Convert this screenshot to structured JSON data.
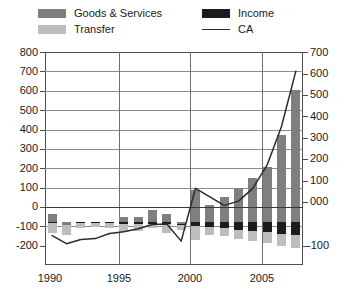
{
  "chart_data": {
    "type": "bar",
    "subtype": "stacked-bar-with-line",
    "title": "",
    "xlabel": "",
    "ylabel": "",
    "ylabel_right": "",
    "grid": true,
    "legend_position": "top",
    "x": [
      1990,
      1991,
      1992,
      1993,
      1994,
      1995,
      1996,
      1997,
      1998,
      1999,
      2000,
      2001,
      2002,
      2003,
      2004,
      2005,
      2006,
      2007
    ],
    "categories": [
      "1990",
      "1991",
      "1992",
      "1993",
      "1994",
      "1995",
      "1996",
      "1997",
      "1998",
      "1999",
      "2000",
      "2001",
      "2002",
      "2003",
      "2004",
      "2005",
      "2006",
      "2007"
    ],
    "xticks": [
      "1990",
      "1995",
      "2000",
      "2005"
    ],
    "xtick_values": [
      1990,
      1995,
      2000,
      2005
    ],
    "yticks_left": [
      "800",
      "700",
      "600",
      "500",
      "400",
      "300",
      "200",
      "100",
      "0",
      "-100",
      "-200"
    ],
    "ytick_values_left": [
      800,
      700,
      600,
      500,
      400,
      300,
      200,
      100,
      0,
      -100,
      -200
    ],
    "ylim": [
      -200,
      800
    ],
    "yticks_right": [
      "700",
      "600",
      "500",
      "400",
      "300",
      "200",
      "100",
      "000",
      "-100"
    ],
    "ytick_values_right": [
      700,
      600,
      500,
      400,
      300,
      200,
      100,
      0,
      -100
    ],
    "ylim_right": [
      -100,
      700
    ],
    "series": [
      {
        "name": "Goods & Services",
        "key": "goods_services",
        "color": "#7f7f7f",
        "stack": "bar",
        "values": [
          38,
          -10,
          4,
          4,
          4,
          26,
          26,
          58,
          40,
          -6,
          150,
          80,
          120,
          160,
          210,
          260,
          410,
          620
        ]
      },
      {
        "name": "Transfer",
        "key": "transfer",
        "color": "#bdbdbd",
        "stack": "bar",
        "values": [
          -46,
          -44,
          -20,
          -18,
          -20,
          -40,
          -34,
          -22,
          -46,
          -22,
          -64,
          -38,
          -40,
          -42,
          -46,
          -52,
          -58,
          -62
        ]
      },
      {
        "name": "Income",
        "key": "income",
        "color": "#1c1c1c",
        "stack": "bar",
        "values": [
          -4,
          -4,
          -4,
          -4,
          -4,
          -6,
          -6,
          -6,
          -6,
          -8,
          -18,
          -22,
          -26,
          -34,
          -40,
          -46,
          -54,
          -58
        ]
      },
      {
        "name": "CA",
        "key": "ca",
        "color": "#2b2b2b",
        "stack": "line",
        "values": [
          -62,
          -100,
          -80,
          -76,
          -52,
          -44,
          -30,
          -10,
          -8,
          -88,
          160,
          120,
          80,
          100,
          160,
          270,
          450,
          710
        ]
      }
    ],
    "legend": [
      {
        "label": "Goods & Services",
        "type": "swatch",
        "color": "#7f7f7f"
      },
      {
        "label": "Transfer",
        "type": "swatch",
        "color": "#bdbdbd"
      },
      {
        "label": "Income",
        "type": "swatch",
        "color": "#1c1c1c"
      },
      {
        "label": "CA",
        "type": "line",
        "color": "#2b2b2b"
      }
    ]
  },
  "legend": {
    "goods_services": "Goods & Services",
    "transfer": "Transfer",
    "income": "Income",
    "ca": "CA"
  },
  "axis": {
    "left": {
      "t800": "800",
      "t700": "700",
      "t600": "600",
      "t500": "500",
      "t400": "400",
      "t300": "300",
      "t200": "200",
      "t100": "100",
      "t0": "0",
      "tm100": "-100",
      "tm200": "-200"
    },
    "right": {
      "t700": "700",
      "t600": "600",
      "t500": "500",
      "t400": "400",
      "t300": "300",
      "t200": "200",
      "t100": "100",
      "t000": "000",
      "tm100": "-100"
    },
    "x": {
      "x1990": "1990",
      "x1995": "1995",
      "x2000": "2000",
      "x2005": "2005"
    }
  },
  "colors": {
    "goods_services": "#7f7f7f",
    "transfer": "#bdbdbd",
    "income": "#1c1c1c",
    "ca_line": "#2b2b2b",
    "frame": "#4d4d4d",
    "grid": "#8c8c8c",
    "background": "#ffffff"
  }
}
